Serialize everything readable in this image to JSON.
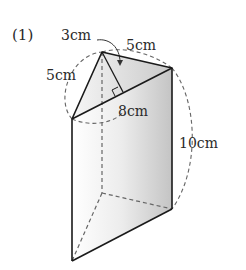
{
  "problem": {
    "number_label": "(1)"
  },
  "figure": {
    "type": "triangular-prism",
    "labels": {
      "height_perp": "3cm",
      "edge_top_right": "5cm",
      "edge_top_left": "5cm",
      "edge_base": "8cm",
      "prism_height": "10cm"
    },
    "colors": {
      "edge": "#1a1a1a",
      "dashed": "#666666",
      "face_light": "#f4f4f4",
      "face_dark": "#cfcfcf"
    }
  }
}
